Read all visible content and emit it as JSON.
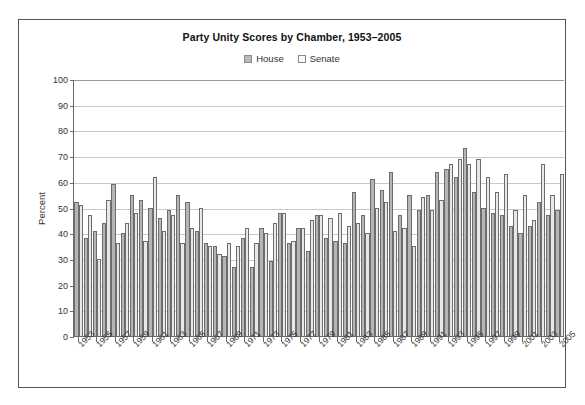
{
  "chart_data": {
    "type": "bar",
    "title": "Party Unity Scores by Chamber, 1953–2005",
    "xlabel": "",
    "ylabel": "Percent",
    "ylim": [
      0,
      100
    ],
    "ytick_step": 10,
    "yticks": [
      0,
      10,
      20,
      30,
      40,
      50,
      60,
      70,
      80,
      90,
      100
    ],
    "grid": true,
    "legend_position": "top-center",
    "legend": [
      "House",
      "Senate"
    ],
    "categories": [
      1953,
      1954,
      1955,
      1956,
      1957,
      1958,
      1959,
      1960,
      1961,
      1962,
      1963,
      1964,
      1965,
      1966,
      1967,
      1968,
      1969,
      1970,
      1971,
      1972,
      1973,
      1974,
      1975,
      1976,
      1977,
      1978,
      1979,
      1980,
      1981,
      1982,
      1983,
      1984,
      1985,
      1986,
      1987,
      1988,
      1989,
      1990,
      1991,
      1992,
      1993,
      1994,
      1995,
      1996,
      1997,
      1998,
      1999,
      2000,
      2001,
      2002,
      2003,
      2004,
      2005
    ],
    "tick_labels": [
      1953,
      1955,
      1957,
      1959,
      1961,
      1963,
      1965,
      1967,
      1969,
      1971,
      1973,
      1975,
      1977,
      1979,
      1981,
      1983,
      1985,
      1987,
      1989,
      1991,
      1993,
      1995,
      1997,
      1999,
      2001,
      2003,
      2005
    ],
    "series": [
      {
        "name": "House",
        "color": "#b5b5b5",
        "values": [
          52,
          38,
          41,
          44,
          59,
          40,
          55,
          53,
          50,
          46,
          49,
          55,
          52,
          41,
          36,
          35,
          31,
          27,
          38,
          27,
          42,
          29,
          48,
          36,
          42,
          33,
          47,
          38,
          37,
          36,
          56,
          47,
          61,
          57,
          64,
          47,
          55,
          49,
          55,
          64,
          65,
          62,
          73,
          56,
          50,
          48,
          47,
          43,
          40,
          43,
          52,
          47,
          49
        ]
      },
      {
        "name": "Senate",
        "color": "#e8e8e8",
        "values": [
          51,
          47,
          30,
          53,
          36,
          44,
          48,
          37,
          62,
          41,
          47,
          36,
          42,
          50,
          35,
          32,
          36,
          35,
          42,
          36,
          40,
          44,
          48,
          37,
          42,
          45,
          47,
          46,
          48,
          43,
          44,
          40,
          50,
          52,
          41,
          42,
          35,
          54,
          49,
          53,
          67,
          69,
          67,
          69,
          62,
          56,
          63,
          49,
          55,
          45,
          67,
          55,
          63
        ]
      }
    ]
  }
}
